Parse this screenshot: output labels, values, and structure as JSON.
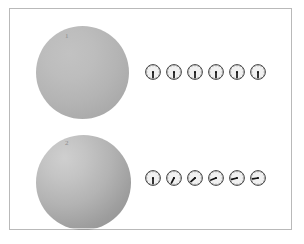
{
  "figure": {
    "background_color": "#ffffff",
    "frame_color": "#b9b9b9"
  },
  "rows": [
    {
      "label": "1",
      "sphere": {
        "name": "sphere-1",
        "fill_light": "#c2c2c2",
        "fill_dark": "#a3a3a3",
        "diameter_px": 93
      },
      "clocks": [
        {
          "index": 1,
          "hand_angle_deg": 180,
          "reading": "6:00"
        },
        {
          "index": 2,
          "hand_angle_deg": 180,
          "reading": "6:00"
        },
        {
          "index": 3,
          "hand_angle_deg": 180,
          "reading": "6:00"
        },
        {
          "index": 4,
          "hand_angle_deg": 180,
          "reading": "6:00"
        },
        {
          "index": 5,
          "hand_angle_deg": 180,
          "reading": "6:00"
        },
        {
          "index": 6,
          "hand_angle_deg": 180,
          "reading": "6:00"
        }
      ]
    },
    {
      "label": "2",
      "sphere": {
        "name": "sphere-2",
        "fill_light": "#cfcfcf",
        "fill_dark": "#8e8e8e",
        "diameter_px": 95
      },
      "clocks": [
        {
          "index": 1,
          "hand_angle_deg": 180,
          "reading": "6:00"
        },
        {
          "index": 2,
          "hand_angle_deg": 207,
          "reading": "6:55"
        },
        {
          "index": 3,
          "hand_angle_deg": 228,
          "reading": "7:36"
        },
        {
          "index": 4,
          "hand_angle_deg": 248,
          "reading": "8:16"
        },
        {
          "index": 5,
          "hand_angle_deg": 256,
          "reading": "8:32"
        },
        {
          "index": 6,
          "hand_angle_deg": 260,
          "reading": "8:40"
        }
      ]
    }
  ]
}
